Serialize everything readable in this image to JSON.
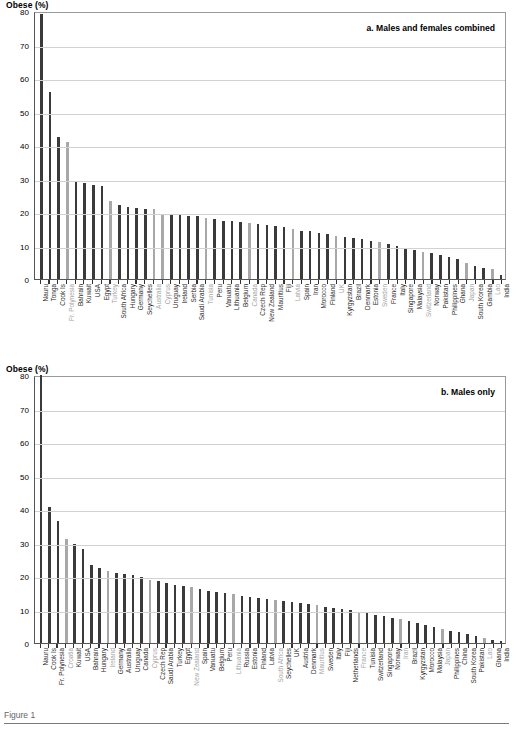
{
  "figure": {
    "caption": "Figure 1",
    "axis_title": "Obese (%)"
  },
  "panels": [
    {
      "id": "a",
      "caption": "a. Males and females combined",
      "axis_title": "Obese (%)"
    },
    {
      "id": "b",
      "caption": "b. Males only",
      "axis_title": "Obese (%)"
    }
  ],
  "chart_data": [
    {
      "type": "bar",
      "title": "a. Males and females combined",
      "xlabel": "",
      "ylabel": "Obese (%)",
      "ylim": [
        0,
        80
      ],
      "yticks": [
        0,
        10,
        20,
        30,
        40,
        50,
        60,
        70,
        80
      ],
      "grid": true,
      "legend": "none",
      "bar_colors": {
        "dark": "#3a3a3a",
        "light": "#a8a8a8"
      },
      "categories": [
        "Nauru",
        "Tonga",
        "Cook Is",
        "Fr. Polynesia",
        "Bahrain",
        "Kuwait",
        "USA",
        "Egypt",
        "Turkey",
        "South Africa",
        "Hungary",
        "Germany",
        "Seychelles",
        "Australia",
        "Cyprus",
        "Uruguay",
        "Ireland",
        "Serbia",
        "Saudi Arabia",
        "Tunisia",
        "Peru",
        "Vanuatu",
        "Lithuania",
        "Belgium",
        "Canada",
        "Czech Rep",
        "New Zealand",
        "Mauritius",
        "Fiji",
        "Latvia",
        "Spain",
        "Iran",
        "Morocco",
        "Finland",
        "UK",
        "Kyrgyzstan",
        "Brazil",
        "Denmark",
        "Estonia",
        "Sweden",
        "France",
        "Italy",
        "Singapore",
        "Malaysia",
        "Switzerland",
        "Norway",
        "Pakistan",
        "Philippines",
        "Ghana",
        "Japan",
        "South Korea",
        "Gambia",
        "Lao",
        "India"
      ],
      "values": [
        79.0,
        55.7,
        42.5,
        40.9,
        29.1,
        28.7,
        28.0,
        27.8,
        23.2,
        22.0,
        21.5,
        21.2,
        21.0,
        20.8,
        19.5,
        19.1,
        19.0,
        18.8,
        18.7,
        18.2,
        17.9,
        17.4,
        17.2,
        16.9,
        16.7,
        16.5,
        16.1,
        15.8,
        15.5,
        14.8,
        14.4,
        14.2,
        13.6,
        13.3,
        12.8,
        12.6,
        12.2,
        11.8,
        11.4,
        11.0,
        10.5,
        10.0,
        9.3,
        8.6,
        8.2,
        7.9,
        7.2,
        6.6,
        6.0,
        4.8,
        4.0,
        3.4,
        3.0,
        1.2
      ],
      "shades": [
        "dark",
        "dark",
        "dark",
        "light",
        "dark",
        "dark",
        "dark",
        "dark",
        "light",
        "dark",
        "dark",
        "dark",
        "dark",
        "light",
        "light",
        "dark",
        "dark",
        "dark",
        "dark",
        "light",
        "dark",
        "dark",
        "dark",
        "dark",
        "light",
        "dark",
        "dark",
        "dark",
        "dark",
        "light",
        "dark",
        "dark",
        "dark",
        "dark",
        "light",
        "dark",
        "dark",
        "dark",
        "dark",
        "light",
        "dark",
        "dark",
        "dark",
        "dark",
        "light",
        "dark",
        "dark",
        "dark",
        "dark",
        "light",
        "dark",
        "dark",
        "light",
        "dark"
      ]
    },
    {
      "type": "bar",
      "title": "b. Males only",
      "xlabel": "",
      "ylabel": "Obese (%)",
      "ylim": [
        0,
        80
      ],
      "yticks": [
        0,
        10,
        20,
        30,
        40,
        50,
        60,
        70,
        80
      ],
      "grid": true,
      "legend": "none",
      "bar_colors": {
        "dark": "#3a3a3a",
        "light": "#a8a8a8"
      },
      "categories": [
        "Nauru",
        "Cook Is",
        "Fr. Polynesia",
        "Croatia",
        "Kuwait",
        "USA",
        "Bahrain",
        "Hungary",
        "Ireland",
        "Germany",
        "Australia",
        "Uruguay",
        "Canada",
        "Cyprus",
        "Czech Rep",
        "Saudi Arabia",
        "Turkey",
        "Egypt",
        "New Zealand",
        "Spain",
        "Vanuatu",
        "Belgium",
        "Peru",
        "Lithuania",
        "Russia",
        "Estonia",
        "Finland",
        "Latvia",
        "South Africa",
        "Seychelles",
        "UK",
        "Austria",
        "Denmark",
        "Mauritius",
        "Sweden",
        "Italy",
        "Fiji",
        "Netherlands",
        "France",
        "Tunisia",
        "Switzerland",
        "Singapore",
        "Norway",
        "Iran",
        "Brazil",
        "Kyrgyzstan",
        "Morocco",
        "Malaysia",
        "Japan",
        "Philippines",
        "China",
        "South Korea",
        "Pakistan",
        "Lao",
        "Ghana",
        "India"
      ],
      "values": [
        80.0,
        40.6,
        36.5,
        31.0,
        29.6,
        28.0,
        23.4,
        22.3,
        21.5,
        21.0,
        20.7,
        20.2,
        19.7,
        18.9,
        18.4,
        17.9,
        17.4,
        17.0,
        16.6,
        16.1,
        15.6,
        15.2,
        14.9,
        14.5,
        14.1,
        13.8,
        13.4,
        13.1,
        12.8,
        12.5,
        12.2,
        11.9,
        11.6,
        11.2,
        10.9,
        10.6,
        10.2,
        9.8,
        9.4,
        9.0,
        8.5,
        8.1,
        7.6,
        7.1,
        6.6,
        6.0,
        5.4,
        4.8,
        4.2,
        3.7,
        3.2,
        2.7,
        2.2,
        1.6,
        1.0,
        0.7
      ],
      "shades": [
        "dark",
        "dark",
        "dark",
        "light",
        "dark",
        "dark",
        "dark",
        "dark",
        "light",
        "dark",
        "dark",
        "dark",
        "dark",
        "light",
        "dark",
        "dark",
        "dark",
        "dark",
        "light",
        "dark",
        "dark",
        "dark",
        "dark",
        "light",
        "dark",
        "dark",
        "dark",
        "dark",
        "light",
        "dark",
        "dark",
        "dark",
        "dark",
        "light",
        "dark",
        "dark",
        "dark",
        "dark",
        "light",
        "dark",
        "dark",
        "dark",
        "dark",
        "light",
        "dark",
        "dark",
        "dark",
        "dark",
        "light",
        "dark",
        "dark",
        "dark",
        "dark",
        "light",
        "dark",
        "dark"
      ]
    }
  ]
}
